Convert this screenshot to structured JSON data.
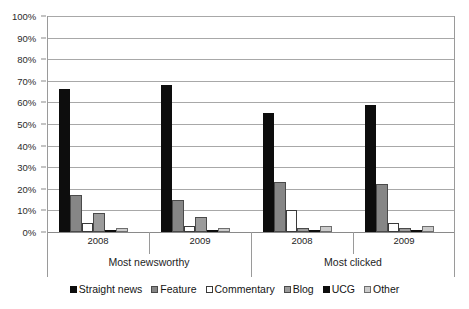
{
  "chart_data": {
    "type": "bar",
    "title": "",
    "subtitle": "",
    "xlabel": "",
    "ylabel": "",
    "ylim": [
      0,
      100
    ],
    "ytick_labels": [
      "100%",
      "90%",
      "80%",
      "70%",
      "60%",
      "50%",
      "40%",
      "30%",
      "20%",
      "10%",
      "0%"
    ],
    "ytick_values": [
      100,
      90,
      80,
      70,
      60,
      50,
      40,
      30,
      20,
      10,
      0
    ],
    "grid": true,
    "legend_position": "bottom",
    "value_suffix": "%",
    "groups": [
      {
        "label": "Most newsworthy",
        "categories": [
          "2008",
          "2009"
        ]
      },
      {
        "label": "Most clicked",
        "categories": [
          "2008",
          "2009"
        ]
      }
    ],
    "categories": [
      "2008",
      "2009",
      "2008",
      "2009"
    ],
    "series": [
      {
        "name": "Straight news",
        "color": "#0d0d0d",
        "values": [
          66,
          68,
          55,
          59
        ]
      },
      {
        "name": "Feature",
        "color": "#868686",
        "values": [
          17,
          15,
          23,
          22
        ]
      },
      {
        "name": "Commentary",
        "color": "#ffffff",
        "values": [
          4,
          3,
          10,
          4
        ]
      },
      {
        "name": "Blog",
        "color": "#9b9b9b",
        "values": [
          9,
          7,
          2,
          2
        ]
      },
      {
        "name": "UCG",
        "color": "#0d0d0d",
        "values": [
          1,
          0.4,
          0.4,
          0.3
        ]
      },
      {
        "name": "Other",
        "color": "#cbcbcb",
        "values": [
          2,
          2,
          3,
          3
        ]
      }
    ]
  }
}
